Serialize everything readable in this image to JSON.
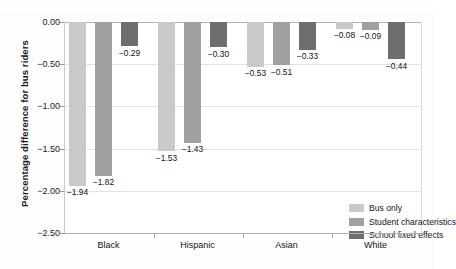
{
  "chart_data": {
    "type": "bar",
    "title": "",
    "xlabel": "",
    "ylabel": "Percentage difference for bus riders",
    "categories": [
      "Black",
      "Hispanic",
      "Asian",
      "White"
    ],
    "ylim": [
      -2.5,
      0.0
    ],
    "ytick_labels": [
      "0.00",
      "-0.50",
      "-1.00",
      "-1.50",
      "-2.00",
      "-2.50"
    ],
    "ytick_values": [
      0.0,
      -0.5,
      -1.0,
      -1.5,
      -2.0,
      -2.5
    ],
    "grid": true,
    "legend_position": "bottom-right-inside",
    "series": [
      {
        "name": "Bus only",
        "color": "#c9c9c9",
        "values": [
          -1.94,
          -1.53,
          -0.53,
          -0.08
        ],
        "labels": [
          "-1.94",
          "-1.53",
          "-0.53",
          "-0.08"
        ]
      },
      {
        "name": "Student characteristics",
        "color": "#a0a0a0",
        "values": [
          -1.82,
          -1.43,
          -0.51,
          -0.09
        ],
        "labels": [
          "-1.82",
          "-1.43",
          "-0.51",
          "-0.09"
        ]
      },
      {
        "name": "School fixed effects",
        "color": "#6e6e6e",
        "values": [
          -0.29,
          -0.3,
          -0.33,
          -0.44
        ],
        "labels": [
          "-0.29",
          "-0.30",
          "-0.33",
          "-0.44"
        ]
      }
    ]
  },
  "colors": {
    "series_1": "#c9c9c9",
    "series_2": "#a0a0a0",
    "series_3": "#6e6e6e",
    "gridline": "#e2e2e2",
    "axis": "#b0b0b0",
    "text": "#141414",
    "plot_background": "#ffffff",
    "figure_background": "#fdfdfd"
  }
}
